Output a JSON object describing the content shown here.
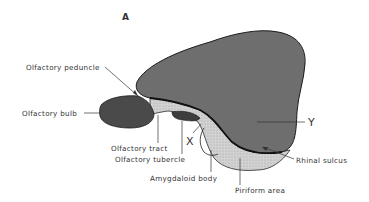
{
  "figure": {
    "panel_label": "A",
    "colors": {
      "cortex": "#6e6e6e",
      "bulb": "#4a4a4a",
      "piriform_stipple": "#c8c8c8",
      "outline": "#1a1a1a",
      "text": "#333333"
    },
    "labels": {
      "olfactory_peduncle": "Olfactory peduncle",
      "olfactory_bulb": "Olfactory bulb",
      "olfactory_tract": "Olfactory tract",
      "olfactory_tubercle": "Olfactory tubercle",
      "amygdaloid_body": "Amygdaloid body",
      "piriform_area": "Piriform area",
      "rhinal_sulcus": "Rhinal sulcus",
      "marker_y": "Y",
      "marker_x": "X"
    }
  }
}
